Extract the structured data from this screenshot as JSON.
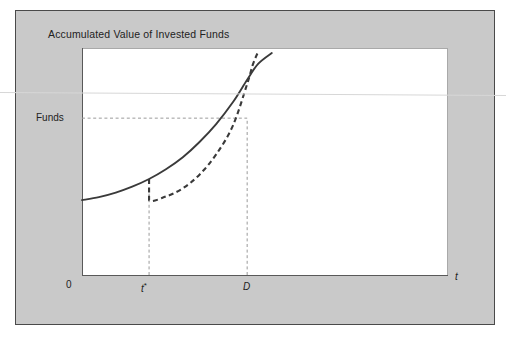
{
  "figure": {
    "title": "Accumulated Value of Invested Funds",
    "background_color": "#c9c9c9",
    "plot_background_color": "#ffffff",
    "border_color": "#4a4a4a",
    "curve_color": "#3a3a3a",
    "guide_color": "#9a9a9a"
  },
  "chart_data": {
    "type": "line",
    "title": "Accumulated Value of Invested Funds",
    "xlabel": "t",
    "ylabel": "Funds",
    "grid": false,
    "legend": null,
    "xlim": [
      0,
      8
    ],
    "ylim": [
      0,
      10
    ],
    "x_tick_labels": [
      "0",
      "t*",
      "D"
    ],
    "x_tick_values": [
      0,
      1.47,
      3.62
    ],
    "y_tick_labels": [
      "Funds"
    ],
    "y_tick_values": [
      6.91
    ],
    "annotations": [
      {
        "name": "funds-level-line",
        "type": "horizontal-dashed",
        "y": 6.91,
        "x_from": 0,
        "x_to": 3.62
      },
      {
        "name": "t-star-drop-line",
        "type": "vertical-dashed",
        "x": 1.47,
        "y_from": 0,
        "y_to": 3.63
      },
      {
        "name": "d-drop-line",
        "type": "vertical-dashed",
        "x": 3.62,
        "y_from": 0,
        "y_to": 6.91
      }
    ],
    "series": [
      {
        "name": "Continuous accumulation",
        "style": "solid",
        "color": "#3a3a3a",
        "x": [
          0.0,
          0.37,
          0.74,
          1.1,
          1.47,
          1.84,
          2.21,
          2.57,
          2.94,
          3.31,
          3.62,
          3.86,
          4.16
        ],
        "y": [
          3.3,
          3.43,
          3.63,
          3.89,
          4.23,
          4.66,
          5.19,
          5.85,
          6.65,
          7.62,
          8.6,
          9.3,
          9.78
        ]
      },
      {
        "name": "Interrupted / restarted accumulation",
        "style": "dashed",
        "color": "#3a3a3a",
        "x": [
          1.47,
          1.47,
          1.84,
          2.21,
          2.57,
          2.94,
          3.31,
          3.62,
          3.75,
          3.86
        ],
        "y": [
          4.23,
          3.3,
          3.46,
          3.82,
          4.41,
          5.31,
          6.59,
          8.42,
          9.3,
          9.83
        ]
      }
    ]
  },
  "labels": {
    "funds": "Funds",
    "zero": "0",
    "t_star": "t",
    "t_star_sup": "*",
    "d": "D",
    "t_axis": "t"
  }
}
